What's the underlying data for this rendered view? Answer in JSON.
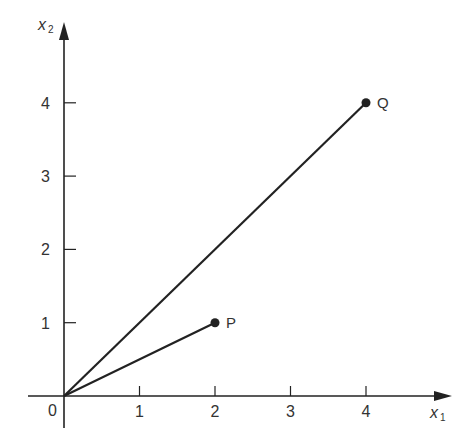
{
  "chart_data": {
    "type": "line",
    "title": "",
    "xlabel": "x1",
    "ylabel": "x2",
    "xlim": [
      0,
      4.5
    ],
    "ylim": [
      0,
      4.5
    ],
    "grid": false,
    "x_ticks": [
      "0",
      "1",
      "2",
      "3",
      "4"
    ],
    "y_ticks": [
      "1",
      "2",
      "3",
      "4"
    ],
    "series": [
      {
        "name": "OP",
        "points": [
          [
            0,
            0
          ],
          [
            2,
            1
          ]
        ],
        "end_label": "P"
      },
      {
        "name": "OQ",
        "points": [
          [
            0,
            0
          ],
          [
            4,
            4
          ]
        ],
        "end_label": "Q"
      }
    ],
    "points": [
      {
        "label": "P",
        "x": 2,
        "y": 1
      },
      {
        "label": "Q",
        "x": 4,
        "y": 4
      }
    ]
  },
  "axes": {
    "x_label_main": "x",
    "x_label_sub": "1",
    "y_label_main": "x",
    "y_label_sub": "2",
    "origin_label": "0"
  },
  "colors": {
    "ink": "#222222",
    "background": "#ffffff"
  }
}
